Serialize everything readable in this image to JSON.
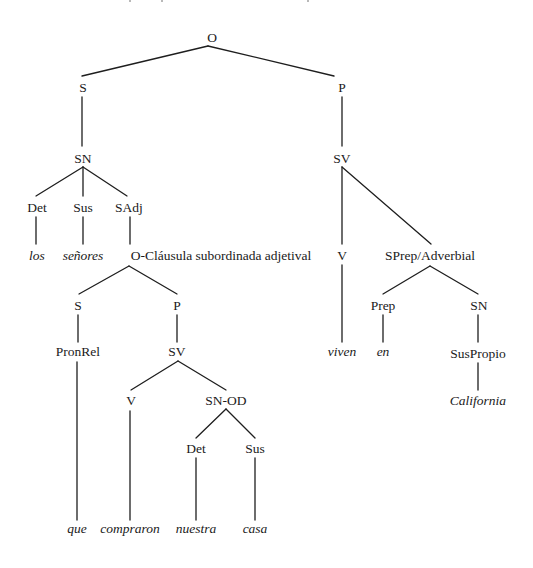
{
  "diagram": {
    "type": "syntax-tree",
    "colors": {
      "line": "#1e1e1e",
      "text": "#1a1a1a",
      "background": "#ffffff"
    },
    "nodes": [
      {
        "id": "O",
        "label": "O",
        "x": 212,
        "y": 42,
        "leaf": false
      },
      {
        "id": "S1",
        "label": "S",
        "x": 83,
        "y": 92,
        "leaf": false
      },
      {
        "id": "P1",
        "label": "P",
        "x": 342,
        "y": 92,
        "leaf": false
      },
      {
        "id": "SN1",
        "label": "SN",
        "x": 83,
        "y": 163,
        "leaf": false
      },
      {
        "id": "SV1",
        "label": "SV",
        "x": 342,
        "y": 163,
        "leaf": false
      },
      {
        "id": "Det1",
        "label": "Det",
        "x": 37,
        "y": 212,
        "leaf": false
      },
      {
        "id": "Sus1",
        "label": "Sus",
        "x": 83,
        "y": 212,
        "leaf": false
      },
      {
        "id": "SAdj",
        "label": "SAdj",
        "x": 129,
        "y": 212,
        "leaf": false
      },
      {
        "id": "los",
        "label": "los",
        "x": 37,
        "y": 260,
        "leaf": true
      },
      {
        "id": "senores",
        "label": "señores",
        "x": 83,
        "y": 260,
        "leaf": true
      },
      {
        "id": "OClaus",
        "label": "O-Cláusula subordinada adjetival",
        "x": 221,
        "y": 260,
        "leaf": false
      },
      {
        "id": "V1",
        "label": "V",
        "x": 342,
        "y": 260,
        "leaf": false
      },
      {
        "id": "SPrep",
        "label": "SPrep/Adverbial",
        "x": 430,
        "y": 260,
        "leaf": false
      },
      {
        "id": "S2",
        "label": "S",
        "x": 78,
        "y": 310,
        "leaf": false
      },
      {
        "id": "P2",
        "label": "P",
        "x": 177,
        "y": 310,
        "leaf": false
      },
      {
        "id": "Prep",
        "label": "Prep",
        "x": 383,
        "y": 310,
        "leaf": false
      },
      {
        "id": "SN2",
        "label": "SN",
        "x": 479,
        "y": 310,
        "leaf": false
      },
      {
        "id": "PronRel",
        "label": "PronRel",
        "x": 78,
        "y": 356,
        "leaf": false
      },
      {
        "id": "SV2",
        "label": "SV",
        "x": 177,
        "y": 356,
        "leaf": false
      },
      {
        "id": "viven",
        "label": "viven",
        "x": 342,
        "y": 356,
        "leaf": true
      },
      {
        "id": "en",
        "label": "en",
        "x": 383,
        "y": 356,
        "leaf": true
      },
      {
        "id": "SusPropio",
        "label": "SusPropio",
        "x": 478,
        "y": 358,
        "leaf": false
      },
      {
        "id": "V2",
        "label": "V",
        "x": 131,
        "y": 405,
        "leaf": false
      },
      {
        "id": "SNOD",
        "label": "SN-OD",
        "x": 226,
        "y": 405,
        "leaf": false
      },
      {
        "id": "California",
        "label": "California",
        "x": 478,
        "y": 405,
        "leaf": true
      },
      {
        "id": "Det2",
        "label": "Det",
        "x": 196,
        "y": 453,
        "leaf": false
      },
      {
        "id": "Sus2",
        "label": "Sus",
        "x": 255,
        "y": 453,
        "leaf": false
      },
      {
        "id": "que",
        "label": "que",
        "x": 77,
        "y": 533,
        "leaf": true
      },
      {
        "id": "compraron",
        "label": "compraron",
        "x": 130,
        "y": 533,
        "leaf": true
      },
      {
        "id": "nuestra",
        "label": "nuestra",
        "x": 196,
        "y": 533,
        "leaf": true
      },
      {
        "id": "casa",
        "label": "casa",
        "x": 255,
        "y": 533,
        "leaf": true
      }
    ],
    "edges": [
      {
        "x1": 208,
        "y1": 46,
        "x2": 82,
        "y2": 76
      },
      {
        "x1": 208,
        "y1": 46,
        "x2": 334,
        "y2": 76
      },
      {
        "x1": 82,
        "y1": 97,
        "x2": 82,
        "y2": 146
      },
      {
        "x1": 342,
        "y1": 97,
        "x2": 342,
        "y2": 146
      },
      {
        "x1": 83,
        "y1": 167,
        "x2": 36,
        "y2": 196
      },
      {
        "x1": 83,
        "y1": 167,
        "x2": 83,
        "y2": 196
      },
      {
        "x1": 83,
        "y1": 167,
        "x2": 127,
        "y2": 196
      },
      {
        "x1": 36,
        "y1": 217,
        "x2": 36,
        "y2": 244
      },
      {
        "x1": 83,
        "y1": 217,
        "x2": 83,
        "y2": 244
      },
      {
        "x1": 130,
        "y1": 217,
        "x2": 130,
        "y2": 244
      },
      {
        "x1": 342,
        "y1": 167,
        "x2": 342,
        "y2": 244
      },
      {
        "x1": 342,
        "y1": 167,
        "x2": 431,
        "y2": 244
      },
      {
        "x1": 129,
        "y1": 266,
        "x2": 79,
        "y2": 294
      },
      {
        "x1": 129,
        "y1": 266,
        "x2": 177,
        "y2": 294
      },
      {
        "x1": 430,
        "y1": 266,
        "x2": 383,
        "y2": 294
      },
      {
        "x1": 430,
        "y1": 266,
        "x2": 478,
        "y2": 294
      },
      {
        "x1": 78,
        "y1": 315,
        "x2": 78,
        "y2": 342
      },
      {
        "x1": 177,
        "y1": 315,
        "x2": 177,
        "y2": 342
      },
      {
        "x1": 342,
        "y1": 265,
        "x2": 342,
        "y2": 342
      },
      {
        "x1": 383,
        "y1": 315,
        "x2": 383,
        "y2": 342
      },
      {
        "x1": 478,
        "y1": 315,
        "x2": 478,
        "y2": 342
      },
      {
        "x1": 178,
        "y1": 361,
        "x2": 131,
        "y2": 390
      },
      {
        "x1": 178,
        "y1": 361,
        "x2": 226,
        "y2": 390
      },
      {
        "x1": 478,
        "y1": 363,
        "x2": 478,
        "y2": 390
      },
      {
        "x1": 226,
        "y1": 409,
        "x2": 196,
        "y2": 438
      },
      {
        "x1": 226,
        "y1": 409,
        "x2": 255,
        "y2": 438
      },
      {
        "x1": 77,
        "y1": 362,
        "x2": 77,
        "y2": 520
      },
      {
        "x1": 130,
        "y1": 411,
        "x2": 130,
        "y2": 520
      },
      {
        "x1": 196,
        "y1": 458,
        "x2": 196,
        "y2": 520
      },
      {
        "x1": 255,
        "y1": 458,
        "x2": 255,
        "y2": 520
      }
    ]
  }
}
